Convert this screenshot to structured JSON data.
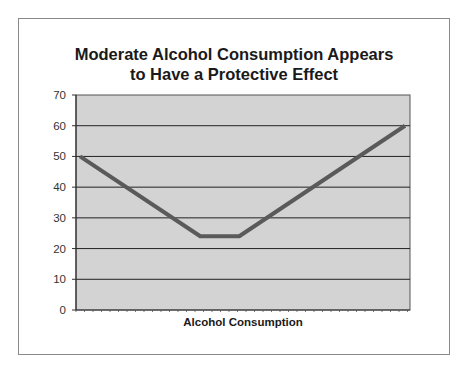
{
  "chart_data": {
    "type": "line",
    "title": "Moderate Alcohol Consumption Appears to Have a Protective Effect",
    "title_lines": [
      "Moderate Alcohol Consumption Appears",
      "to Have a Protective Effect"
    ],
    "xlabel": "Alcohol Consumption",
    "ylabel": "",
    "ylim": [
      0,
      70
    ],
    "yticks": [
      0,
      10,
      20,
      30,
      40,
      50,
      60,
      70
    ],
    "grid": true,
    "legend": "none",
    "background": "#d3d3d3",
    "line_color": "#5a5a5a",
    "x": [
      0,
      0.37,
      0.49,
      1.0
    ],
    "series": [
      {
        "name": "Risk",
        "values": [
          50,
          24,
          24,
          60
        ]
      }
    ]
  }
}
